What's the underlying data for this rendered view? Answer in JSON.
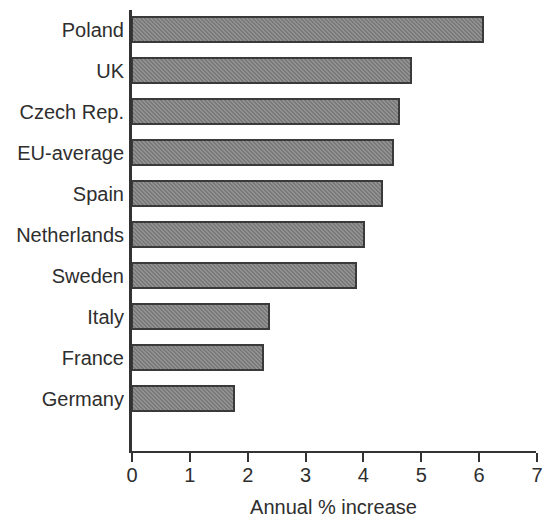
{
  "chart_data": {
    "type": "bar",
    "orientation": "horizontal",
    "title": "",
    "subtitle": "",
    "xlabel": "Annual % increase",
    "ylabel": "",
    "xlim": [
      0,
      7
    ],
    "xticks": [
      "0",
      "1",
      "2",
      "3",
      "4",
      "5",
      "6",
      "7"
    ],
    "grid": false,
    "legend": null,
    "categories": [
      "Poland",
      "UK",
      "Czech Rep.",
      "EU-average",
      "Spain",
      "Netherlands",
      "Sweden",
      "Italy",
      "France",
      "Germany"
    ],
    "values": [
      6.1,
      4.85,
      4.65,
      4.55,
      4.35,
      4.05,
      3.9,
      2.4,
      2.3,
      1.8
    ],
    "series": [
      {
        "name": "Annual % increase",
        "values": [
          6.1,
          4.85,
          4.65,
          4.55,
          4.35,
          4.05,
          3.9,
          2.4,
          2.3,
          1.8
        ]
      }
    ],
    "colors": {
      "bar_fill": "#808080",
      "bar_border": "#3a3a3a",
      "axis": "#333333",
      "text": "#2e2e2e",
      "background": "#ffffff"
    }
  }
}
